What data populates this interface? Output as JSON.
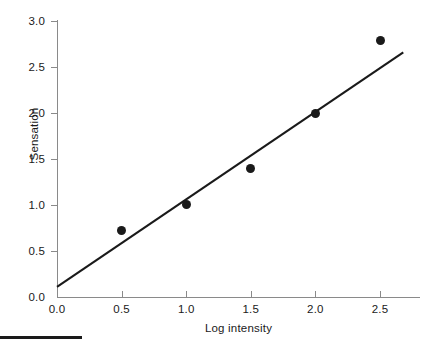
{
  "chart_data": {
    "type": "scatter",
    "title": "",
    "subtitle": "",
    "xlabel": "Log intensity",
    "ylabel": "Sensation",
    "xlim": [
      0.0,
      2.68
    ],
    "ylim": [
      0.0,
      3.0
    ],
    "xticks": [
      "0.0",
      "0.5",
      "1.0",
      "1.5",
      "2.0",
      "2.5"
    ],
    "xtick_values": [
      0.0,
      0.5,
      1.0,
      1.5,
      2.0,
      2.5
    ],
    "yticks": [
      "0.0",
      "0.5",
      "1.0",
      "1.5",
      "2.0",
      "2.5",
      "3.0"
    ],
    "ytick_values": [
      0.0,
      0.5,
      1.0,
      1.5,
      2.0,
      2.5,
      3.0
    ],
    "grid": false,
    "legend": null,
    "legend_position": "none",
    "marker_color": "#1a1a1a",
    "line_color": "#1a1a1a",
    "axis_color": "#8a8a8a",
    "x": [
      0.5,
      1.0,
      1.5,
      2.0,
      2.5
    ],
    "values": [
      0.72,
      1.01,
      1.4,
      2.0,
      2.79
    ],
    "series": [
      {
        "name": "Sensation vs log intensity",
        "x": [
          0.5,
          1.0,
          1.5,
          2.0,
          2.5
        ],
        "values": [
          0.72,
          1.01,
          1.4,
          2.0,
          2.79
        ]
      }
    ],
    "points": [
      {
        "x": 0.5,
        "y": 0.72
      },
      {
        "x": 1.0,
        "y": 1.01
      },
      {
        "x": 1.5,
        "y": 1.4
      },
      {
        "x": 2.0,
        "y": 2.0
      },
      {
        "x": 2.5,
        "y": 2.79
      }
    ],
    "fit_line": {
      "type": "linear",
      "x_start": 0.0,
      "y_start": 0.11,
      "x_end": 2.68,
      "y_end": 2.66,
      "slope": 0.95,
      "intercept": 0.11
    },
    "annotations": [],
    "footer_rule": true
  },
  "axes": {
    "ylabel": "Sensation",
    "xlabel": "Log intensity"
  }
}
